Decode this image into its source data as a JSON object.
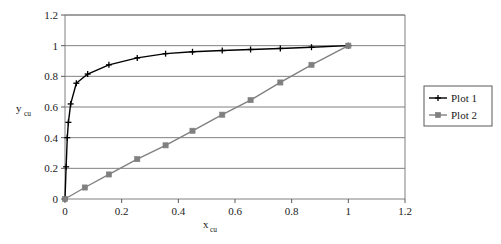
{
  "chart_data": {
    "type": "line",
    "title": "",
    "xlabel": "x_cu",
    "ylabel": "y_cu",
    "xlabel_base": "x",
    "xlabel_sub": "cu",
    "ylabel_base": "y",
    "ylabel_sub": "cu",
    "xlim": [
      0,
      1.2
    ],
    "ylim": [
      0,
      1.2
    ],
    "xticks": [
      0,
      0.2,
      0.4,
      0.6,
      0.8,
      1,
      1.2
    ],
    "yticks": [
      0,
      0.2,
      0.4,
      0.6,
      0.8,
      1,
      1.2
    ],
    "xtick_labels": [
      "0",
      "0.2",
      "0.4",
      "0.6",
      "0.8",
      "1",
      "1.2"
    ],
    "ytick_labels": [
      "0",
      "0.2",
      "0.4",
      "0.6",
      "0.8",
      "1",
      "1.2"
    ],
    "grid": {
      "horizontal": true,
      "vertical": false,
      "color": "#808080"
    },
    "legend": {
      "position": "right",
      "border": true
    },
    "plot_area_bg": "#ffffff",
    "series": [
      {
        "name": "Plot 1",
        "color": "#000000",
        "marker": "cross",
        "marker_color": "#000000",
        "x": [
          0,
          0.004,
          0.008,
          0.012,
          0.02,
          0.04,
          0.08,
          0.155,
          0.255,
          0.355,
          0.45,
          0.555,
          0.655,
          0.76,
          0.87,
          1
        ],
        "y": [
          0,
          0.21,
          0.4,
          0.5,
          0.62,
          0.755,
          0.815,
          0.875,
          0.92,
          0.948,
          0.96,
          0.968,
          0.975,
          0.982,
          0.99,
          1
        ]
      },
      {
        "name": "Plot 2",
        "color": "#808080",
        "marker": "square",
        "marker_color": "#808080",
        "x": [
          0,
          0.07,
          0.155,
          0.255,
          0.355,
          0.45,
          0.555,
          0.655,
          0.76,
          0.87,
          1
        ],
        "y": [
          0,
          0.075,
          0.16,
          0.26,
          0.35,
          0.445,
          0.55,
          0.645,
          0.76,
          0.875,
          1
        ]
      }
    ]
  },
  "legend": {
    "items": [
      {
        "label": "Plot 1",
        "color": "#000000",
        "marker": "cross"
      },
      {
        "label": "Plot 2",
        "color": "#808080",
        "marker": "square"
      }
    ]
  }
}
